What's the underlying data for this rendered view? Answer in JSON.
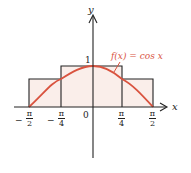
{
  "diagram": {
    "function_label": "f(x) = cos x",
    "axis_x_label": "x",
    "axis_y_label": "y",
    "origin_label": "0",
    "y_tick_label": "1",
    "x_ticks": [
      {
        "sign": "−",
        "num": "π",
        "den": "2"
      },
      {
        "sign": "−",
        "num": "π",
        "den": "4"
      },
      {
        "sign": "",
        "num": "π",
        "den": "4"
      },
      {
        "sign": "",
        "num": "π",
        "den": "2"
      }
    ],
    "rectangles": [
      {
        "x_from": "-π/2",
        "x_to": "-π/4",
        "height": 0.7071
      },
      {
        "x_from": "-π/4",
        "x_to": "π/4",
        "height": 1
      },
      {
        "x_from": "π/4",
        "x_to": "π/2",
        "height": 0.7071
      }
    ],
    "colors": {
      "curve": "#d9533f",
      "label": "#d9533f",
      "fill": "#faeeea",
      "axes": "#222222"
    }
  }
}
